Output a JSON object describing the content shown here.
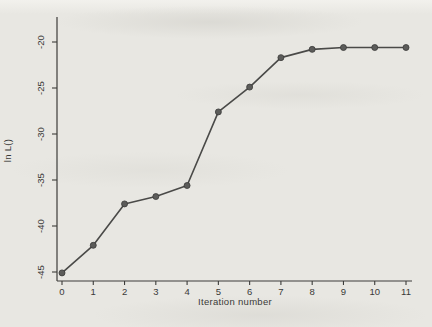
{
  "figure": {
    "background_color": "#e8e7e2",
    "axis_color": "#3c3c3a",
    "line_color": "#4a4a48",
    "marker_fill": "#5c5c5a",
    "marker_stroke": "#3a3a38",
    "text_color": "#3a3a38"
  },
  "chart_data": {
    "type": "line",
    "title": "",
    "xlabel": "Iteration number",
    "ylabel": "ln L()",
    "x": [
      0,
      1,
      2,
      3,
      4,
      5,
      6,
      7,
      8,
      9,
      10,
      11
    ],
    "y": [
      -45.1,
      -42.1,
      -37.6,
      -36.8,
      -35.6,
      -27.6,
      -24.9,
      -21.7,
      -20.8,
      -20.6,
      -20.6,
      -20.6
    ],
    "series_name": "log likelihood",
    "x_ticks": [
      0,
      1,
      2,
      3,
      4,
      5,
      6,
      7,
      8,
      9,
      10,
      11
    ],
    "y_ticks": [
      -45,
      -40,
      -35,
      -30,
      -25,
      -20
    ],
    "xlim": [
      0,
      11
    ],
    "ylim": [
      -45,
      -20
    ],
    "grid": false,
    "legend_position": "none",
    "marker": "circle",
    "y_tick_labels_rotated": true
  }
}
